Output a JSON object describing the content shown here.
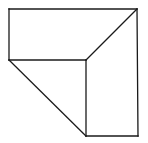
{
  "diagram": {
    "type": "line-drawing",
    "stroke_color": "#1a1a1a",
    "background": "#ffffff",
    "vertices": {
      "A": [
        9,
        9
      ],
      "B": [
        137,
        9
      ],
      "C": [
        9,
        60
      ],
      "D": [
        86,
        60
      ],
      "E": [
        86,
        136
      ],
      "F": [
        138,
        136
      ]
    },
    "edges": [
      [
        "A",
        "B"
      ],
      [
        "A",
        "C"
      ],
      [
        "C",
        "D"
      ],
      [
        "B",
        "D"
      ],
      [
        "C",
        "E"
      ],
      [
        "D",
        "E"
      ],
      [
        "B",
        "F"
      ],
      [
        "E",
        "F"
      ]
    ]
  }
}
